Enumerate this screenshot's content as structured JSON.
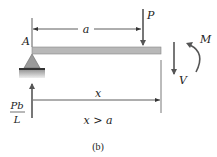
{
  "diagram": {
    "caption": "(b)",
    "labels": {
      "support_point": "A",
      "distance_a": "a",
      "load": "P",
      "moment": "M",
      "shear": "V",
      "reaction_num": "Pb",
      "reaction_den": "L",
      "distance_x": "x",
      "condition": "x > a"
    },
    "colors": {
      "beam": "#b8b8b8",
      "arrows": "#555555",
      "dimension_lines": "#333333",
      "support": "#9a9a9a",
      "text": "#222222"
    }
  }
}
